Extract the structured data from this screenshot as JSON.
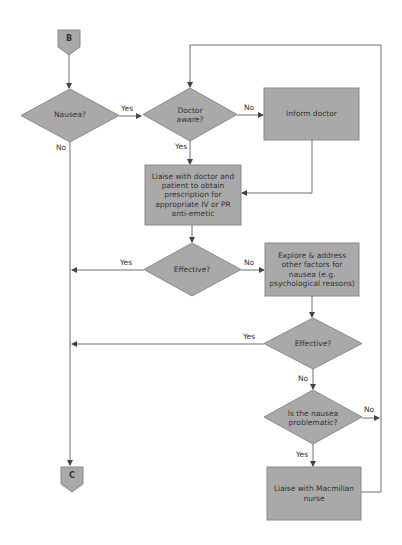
{
  "connectors": {
    "start": "B",
    "end": "C"
  },
  "nodes": {
    "nausea": "Nausea?",
    "doctor_aware": "Doctor aware?",
    "inform_doctor": "Inform doctor",
    "liaise_doctor": "Liaise with doctor and patient to obtain prescription for appropriate IV or PR anti-emetic",
    "effective_1": "Effective?",
    "explore": "Explore & address other factors for nausea (e.g. psychological reasons)",
    "effective_2": "Effective?",
    "problematic": "Is the nausea problematic?",
    "liaise_macmillan": "Liaise with Macmillan nurse"
  },
  "edges": {
    "nausea_yes": "Yes",
    "nausea_no": "No",
    "doctor_aware_no": "No",
    "doctor_aware_yes": "Yes",
    "effective_1_yes": "Yes",
    "effective_1_no": "No",
    "effective_2_yes": "Yes",
    "effective_2_no": "No",
    "problematic_no": "No",
    "problematic_yes": "Yes"
  },
  "colors": {
    "shape_fill": "#a9a9a9",
    "line": "#6e6e6e"
  }
}
